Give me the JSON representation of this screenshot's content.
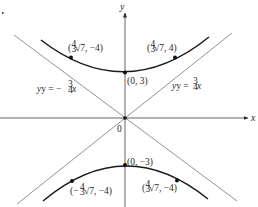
{
  "figure": {
    "axes": {
      "x_label": "x",
      "y_label": "y",
      "origin_label": "0"
    },
    "asymptotes": [
      {
        "label_prefix": "y = −",
        "num": "3",
        "den": "4",
        "suffix": "x",
        "slope": "-3/4"
      },
      {
        "label_prefix": "y = ",
        "num": "3",
        "den": "4",
        "suffix": "x",
        "slope": "3/4"
      }
    ],
    "hyperbola": {
      "equation_implied": "y²/9 − x²/16 = 1",
      "vertices": [
        {
          "label": "(0, 3)"
        },
        {
          "label": "(0, −3)"
        }
      ],
      "points": [
        {
          "label_open": "(",
          "coef_num": "4",
          "coef_den": "3",
          "rest": "√7, −4)",
          "branch": "upper-left"
        },
        {
          "label_open": "(",
          "coef_num": "4",
          "coef_den": "3",
          "rest": "√7, 4)",
          "branch": "upper-right"
        },
        {
          "label_open": "(−",
          "coef_num": "4",
          "coef_den": "3",
          "rest": "√7, −4)",
          "branch": "lower-left"
        },
        {
          "label_open": "(",
          "coef_num": "4",
          "coef_den": "3",
          "rest": "√7, −4)",
          "branch": "lower-right"
        }
      ]
    }
  }
}
